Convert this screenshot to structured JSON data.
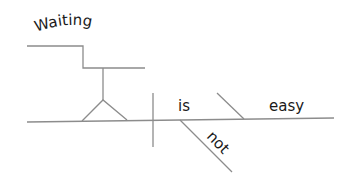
{
  "diagram": {
    "type": "sentence-diagram",
    "sentence": "Waiting is not easy",
    "subject": {
      "word": "Waiting",
      "role": "gerund-subject"
    },
    "verb": {
      "word": "is"
    },
    "modifier": {
      "word": "not",
      "role": "adverb"
    },
    "complement": {
      "word": "easy",
      "role": "predicate-adjective"
    },
    "line_color": "#8c8c8c",
    "text_color": "#1a1a1a"
  }
}
